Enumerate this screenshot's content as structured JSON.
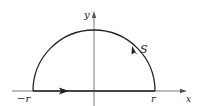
{
  "figure": {
    "type": "semicircular contour diagram",
    "axes": {
      "x_label": "x",
      "y_label": "y"
    },
    "labels": {
      "left_endpoint": "−r",
      "right_endpoint": "r",
      "arc_label": "S"
    },
    "geometry": {
      "center": [
        94,
        91
      ],
      "radius": 61,
      "orientation": "counterclockwise",
      "diameter_arrow_direction": "right",
      "arc_arrow_direction": "up-left"
    },
    "colors": {
      "stroke": "#222222",
      "axis": "#555555",
      "background": "#ffffff"
    }
  }
}
